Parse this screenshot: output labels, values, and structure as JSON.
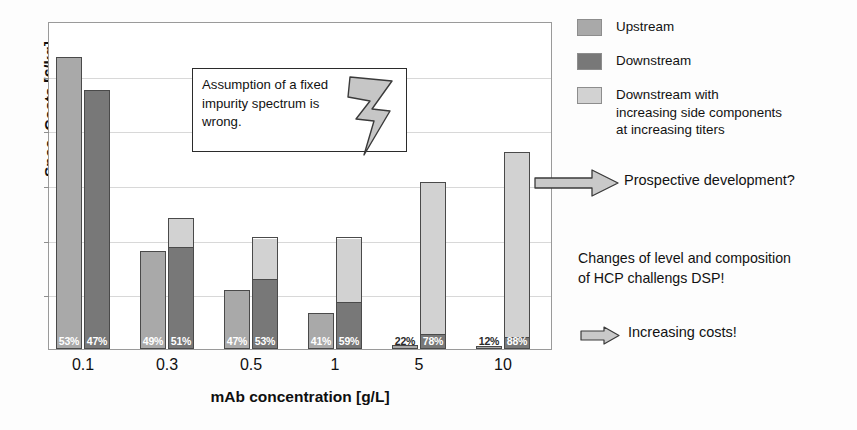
{
  "chart_data": {
    "type": "bar",
    "title": "",
    "xlabel": "mAb concentration [g/L]",
    "ylabel": "Spec. Costs [€/kg]",
    "categories": [
      "0.1",
      "0.3",
      "0.5",
      "1",
      "5",
      "10"
    ],
    "grid": true,
    "ylim": [
      0,
      100
    ],
    "y_tick_labels": [],
    "y_gridline_count": 6,
    "legend_position": "right",
    "series": [
      {
        "name": "Upstream",
        "color": "#a9a9a9",
        "values": [
          89,
          30,
          18,
          11,
          1.2,
          0.6
        ]
      },
      {
        "name": "Downstream",
        "color": "#787878",
        "values": [
          79,
          31,
          21,
          14,
          4,
          3
        ]
      },
      {
        "name": "Downstream with increasing side components at increasing titers",
        "color": "#d2d2d2",
        "values": [
          0,
          9,
          13,
          20,
          47,
          57
        ]
      }
    ],
    "data_labels": [
      {
        "category": "0.1",
        "upstream_pct": "53%",
        "downstream_pct": "47%"
      },
      {
        "category": "0.3",
        "upstream_pct": "49%",
        "downstream_pct": "51%"
      },
      {
        "category": "0.5",
        "upstream_pct": "47%",
        "downstream_pct": "53%"
      },
      {
        "category": "1",
        "upstream_pct": "41%",
        "downstream_pct": "59%"
      },
      {
        "category": "5",
        "upstream_pct": "22%",
        "downstream_pct": "78%"
      },
      {
        "category": "10",
        "upstream_pct": "12%",
        "downstream_pct": "88%"
      }
    ],
    "annotations": [
      "Assumption of a fixed impurity spectrum is wrong.",
      "Prospective development?",
      "Changes of level and composition of HCP challengs DSP!",
      "Increasing costs!"
    ]
  },
  "axes": {
    "y_title": "Spec. Costs [€/kg]",
    "x_title": "mAb concentration [g/L]",
    "x_ticks": [
      "0.1",
      "0.3",
      "0.5",
      "1",
      "5",
      "10"
    ]
  },
  "legend": {
    "items": [
      {
        "label": "Upstream",
        "color": "#a9a9a9"
      },
      {
        "label": "Downstream",
        "color": "#787878"
      },
      {
        "label": "Downstream with\nincreasing side components\nat increasing titers",
        "color": "#d2d2d2"
      }
    ],
    "item3_line1": "Downstream with",
    "item3_line2": "increasing side components",
    "item3_line3": "at increasing titers"
  },
  "callout": {
    "line1": "Assumption of a fixed",
    "line2": "impurity spectrum is",
    "line3": "wrong.",
    "icon": "lightning-bolt"
  },
  "annotations": {
    "prospective": "Prospective development?",
    "changes_line1": "Changes of level and composition",
    "changes_line2": "of HCP challengs DSP!",
    "increasing_costs": "Increasing costs!"
  },
  "bars": [
    {
      "cat": "0.1",
      "up": 89,
      "down_dark": 79,
      "down_light": 0,
      "up_pct": "53%",
      "down_pct": "47%"
    },
    {
      "cat": "0.3",
      "up": 30,
      "down_dark": 31,
      "down_light": 9,
      "up_pct": "49%",
      "down_pct": "51%"
    },
    {
      "cat": "0.5",
      "up": 18,
      "down_dark": 21,
      "down_light": 13,
      "up_pct": "47%",
      "down_pct": "53%"
    },
    {
      "cat": "1",
      "up": 11,
      "down_dark": 14,
      "down_light": 20,
      "up_pct": "41%",
      "down_pct": "59%"
    },
    {
      "cat": "5",
      "up": 1.2,
      "down_dark": 4,
      "down_light": 47,
      "up_pct": "22%",
      "down_pct": "78%"
    },
    {
      "cat": "10",
      "up": 0.6,
      "down_dark": 3,
      "down_light": 57,
      "up_pct": "12%",
      "down_pct": "88%"
    }
  ]
}
